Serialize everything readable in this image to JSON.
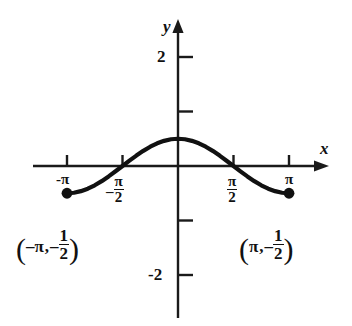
{
  "chart_data": {
    "type": "line",
    "title": "",
    "subtitle": "",
    "xlabel": "x",
    "ylabel": "y",
    "xlim": [
      -3.9,
      4.3
    ],
    "ylim": [
      -2.6,
      2.45
    ],
    "grid": false,
    "legend": null,
    "function": "y = (1/2)cos(x)",
    "domain": [
      -3.14159,
      3.14159
    ],
    "x": [
      -3.1416,
      -2.9452,
      -2.7489,
      -2.5525,
      -2.3562,
      -2.1598,
      -1.9635,
      -1.7671,
      -1.5708,
      -1.3744,
      -1.1781,
      -0.9817,
      -0.7854,
      -0.589,
      -0.3927,
      -0.1963,
      0,
      0.1963,
      0.3927,
      0.589,
      0.7854,
      0.9817,
      1.1781,
      1.3744,
      1.5708,
      1.7671,
      1.9635,
      2.1598,
      2.3562,
      2.5525,
      2.7489,
      2.9452,
      3.1416
    ],
    "y": [
      -0.5,
      -0.4904,
      -0.4619,
      -0.4157,
      -0.3536,
      -0.2778,
      -0.1913,
      -0.0975,
      0,
      0.0975,
      0.1913,
      0.2778,
      0.3536,
      0.4157,
      0.4619,
      0.4904,
      0.5,
      0.4904,
      0.4619,
      0.4157,
      0.3536,
      0.2778,
      0.1913,
      0.0975,
      0,
      -0.0975,
      -0.1913,
      -0.2778,
      -0.3536,
      -0.4157,
      -0.4619,
      -0.4904,
      -0.5
    ],
    "x_ticks": [
      {
        "value": -3.14159,
        "label": "-π",
        "kind": "pi"
      },
      {
        "value": -1.5708,
        "label": "-π/2",
        "kind": "fraction",
        "sign": "–",
        "num": "π",
        "den": "2"
      },
      {
        "value": 1.5708,
        "label": "π/2",
        "kind": "fraction",
        "sign": "",
        "num": "π",
        "den": "2"
      },
      {
        "value": 3.14159,
        "label": "π",
        "kind": "pi"
      }
    ],
    "y_ticks": [
      {
        "value": 2,
        "label": "2"
      },
      {
        "value": 1,
        "label": ""
      },
      {
        "value": -1,
        "label": ""
      },
      {
        "value": -2,
        "label": "-2"
      }
    ],
    "points": [
      {
        "x": -3.14159,
        "y": -0.5,
        "style": "filled-dot"
      },
      {
        "x": 3.14159,
        "y": -0.5,
        "style": "filled-dot"
      }
    ],
    "annotations": [
      {
        "id": "left-endpoint-coordinate",
        "text": "(-π, -1/2)",
        "open_paren": "(",
        "close_paren": ")",
        "x_part": "–π",
        "comma": ",",
        "y_sign": "–",
        "y_num": "1",
        "y_den": "2"
      },
      {
        "id": "right-endpoint-coordinate",
        "text": "(π, -1/2)",
        "open_paren": "(",
        "close_paren": ")",
        "x_part": "π",
        "comma": ",",
        "y_sign": "–",
        "y_num": "1",
        "y_den": "2"
      }
    ],
    "axis_arrow_labels": {
      "x": "x",
      "y": "y"
    },
    "colors": {
      "curve": "#111111",
      "axis": "#1a1a1a",
      "background": "#ffffff"
    }
  }
}
